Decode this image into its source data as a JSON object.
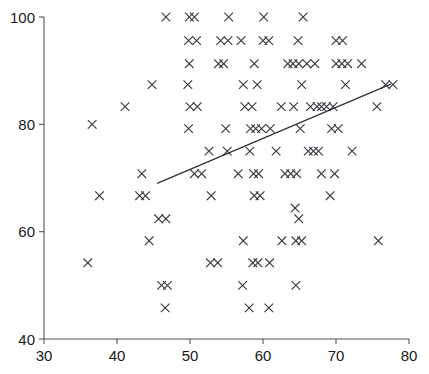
{
  "chart_data": {
    "type": "scatter",
    "title": "",
    "subtitle": "",
    "xlabel": "",
    "ylabel": "",
    "xlim": [
      30,
      80
    ],
    "ylim": [
      40,
      100
    ],
    "xticks": [
      30,
      40,
      50,
      60,
      70,
      80
    ],
    "yticks": [
      40,
      60,
      80,
      100
    ],
    "xtick_labels": [
      "30",
      "40",
      "50",
      "60",
      "70",
      "80"
    ],
    "ytick_labels": [
      "40",
      "60",
      "80",
      "100"
    ],
    "grid": false,
    "legend": null,
    "legend_position": "none",
    "marker": "x",
    "marker_color": "#3a3a42",
    "series": [
      {
        "name": "observations",
        "marker": "x",
        "points": [
          [
            46.7,
            100.0
          ],
          [
            49.9,
            100.0
          ],
          [
            50.6,
            100.0
          ],
          [
            55.3,
            100.0
          ],
          [
            60.1,
            100.0
          ],
          [
            65.5,
            100.0
          ],
          [
            49.8,
            95.6
          ],
          [
            50.9,
            95.6
          ],
          [
            54.2,
            95.6
          ],
          [
            55.2,
            95.6
          ],
          [
            57.0,
            95.6
          ],
          [
            60.0,
            95.6
          ],
          [
            60.8,
            95.6
          ],
          [
            64.8,
            95.6
          ],
          [
            70.0,
            95.6
          ],
          [
            70.9,
            95.6
          ],
          [
            49.9,
            91.3
          ],
          [
            53.9,
            91.3
          ],
          [
            54.6,
            91.3
          ],
          [
            58.8,
            91.3
          ],
          [
            63.4,
            91.3
          ],
          [
            64.1,
            91.3
          ],
          [
            64.9,
            91.3
          ],
          [
            66.0,
            91.3
          ],
          [
            67.1,
            91.3
          ],
          [
            70.0,
            91.3
          ],
          [
            70.8,
            91.3
          ],
          [
            71.6,
            91.3
          ],
          [
            73.5,
            91.3
          ],
          [
            44.8,
            87.4
          ],
          [
            49.7,
            87.4
          ],
          [
            57.3,
            87.4
          ],
          [
            59.2,
            87.4
          ],
          [
            65.3,
            87.4
          ],
          [
            71.3,
            87.4
          ],
          [
            76.8,
            87.4
          ],
          [
            77.8,
            87.4
          ],
          [
            41.1,
            83.3
          ],
          [
            50.0,
            83.3
          ],
          [
            51.0,
            83.3
          ],
          [
            57.5,
            83.3
          ],
          [
            58.5,
            83.3
          ],
          [
            62.5,
            83.3
          ],
          [
            64.2,
            83.3
          ],
          [
            66.5,
            83.3
          ],
          [
            67.4,
            83.3
          ],
          [
            68.0,
            83.3
          ],
          [
            68.7,
            83.3
          ],
          [
            69.6,
            83.3
          ],
          [
            75.6,
            83.3
          ],
          [
            36.6,
            80.0
          ],
          [
            49.8,
            79.2
          ],
          [
            54.9,
            79.2
          ],
          [
            58.3,
            79.2
          ],
          [
            59.0,
            79.2
          ],
          [
            59.8,
            79.2
          ],
          [
            61.0,
            79.2
          ],
          [
            65.1,
            79.2
          ],
          [
            69.4,
            79.2
          ],
          [
            70.3,
            79.2
          ],
          [
            52.6,
            75.0
          ],
          [
            55.1,
            75.0
          ],
          [
            58.2,
            75.0
          ],
          [
            61.8,
            75.0
          ],
          [
            66.2,
            75.0
          ],
          [
            66.9,
            75.0
          ],
          [
            67.6,
            75.0
          ],
          [
            72.2,
            75.0
          ],
          [
            43.4,
            70.8
          ],
          [
            50.6,
            70.8
          ],
          [
            51.6,
            70.8
          ],
          [
            56.6,
            70.8
          ],
          [
            58.7,
            70.8
          ],
          [
            59.4,
            70.8
          ],
          [
            63.0,
            70.8
          ],
          [
            63.8,
            70.8
          ],
          [
            64.6,
            70.8
          ],
          [
            68.0,
            70.8
          ],
          [
            69.8,
            70.8
          ],
          [
            37.6,
            66.7
          ],
          [
            43.1,
            66.7
          ],
          [
            43.9,
            66.7
          ],
          [
            52.9,
            66.7
          ],
          [
            58.8,
            66.7
          ],
          [
            59.6,
            66.7
          ],
          [
            69.2,
            66.7
          ],
          [
            45.7,
            62.4
          ],
          [
            46.7,
            62.4
          ],
          [
            64.9,
            62.4
          ],
          [
            44.4,
            58.3
          ],
          [
            57.3,
            58.3
          ],
          [
            62.6,
            58.3
          ],
          [
            64.4,
            64.4
          ],
          [
            64.5,
            58.3
          ],
          [
            65.3,
            58.3
          ],
          [
            75.8,
            58.3
          ],
          [
            36.0,
            54.2
          ],
          [
            52.8,
            54.2
          ],
          [
            53.8,
            54.2
          ],
          [
            58.6,
            54.2
          ],
          [
            59.3,
            54.2
          ],
          [
            60.9,
            54.2
          ],
          [
            46.1,
            50.0
          ],
          [
            46.9,
            50.0
          ],
          [
            57.2,
            50.0
          ],
          [
            64.5,
            50.0
          ],
          [
            46.6,
            45.8
          ],
          [
            58.1,
            45.8
          ],
          [
            60.8,
            45.8
          ]
        ]
      }
    ],
    "fit_line": {
      "name": "regression-line",
      "x_start": 45.5,
      "y_start": 69.0,
      "x_end": 77.5,
      "y_end": 87.5,
      "color": "#30303a"
    }
  },
  "axes": {
    "x_axis_name": "x-axis",
    "y_axis_name": "y-axis"
  }
}
